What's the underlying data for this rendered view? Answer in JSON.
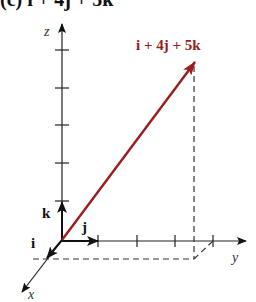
{
  "figure": {
    "title": "(c) i + 4j + 5k",
    "vector_label": "i + 4j + 5k",
    "vector_color": "#9a1c1c",
    "axes": {
      "x_label": "x",
      "y_label": "y",
      "z_label": "z"
    },
    "unit_vectors": {
      "i": "i",
      "j": "j",
      "k": "k"
    },
    "vector_components": {
      "i": 1,
      "j": 4,
      "k": 5
    },
    "y_axis_ticks": 4,
    "z_axis_ticks": 5
  }
}
